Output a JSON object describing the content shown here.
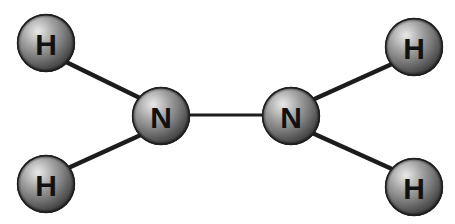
{
  "diagram": {
    "formula": "N2H4",
    "background_color": "#ffffff",
    "canvas": {
      "width": 455,
      "height": 224
    },
    "style": {
      "sphere_highlight_color": "#e6e6e6",
      "sphere_mid_color": "#8a8a8a",
      "sphere_edge_color": "#3a3a3a",
      "sphere_rim_color": "#1e1e1e",
      "bond_color": "#1c1c1c",
      "label_color": "#111111"
    },
    "atoms": [
      {
        "id": "h-top-left",
        "element": "H",
        "label": "H",
        "cx": 46,
        "cy": 43,
        "r": 29,
        "font_size": 30
      },
      {
        "id": "h-bottom-left",
        "element": "H",
        "label": "H",
        "cx": 46,
        "cy": 184,
        "r": 29,
        "font_size": 30
      },
      {
        "id": "n-left",
        "element": "N",
        "label": "N",
        "cx": 161,
        "cy": 116,
        "r": 29,
        "font_size": 30
      },
      {
        "id": "n-right",
        "element": "N",
        "label": "N",
        "cx": 291,
        "cy": 116,
        "r": 29,
        "font_size": 30
      },
      {
        "id": "h-top-right",
        "element": "H",
        "label": "H",
        "cx": 414,
        "cy": 47,
        "r": 29,
        "font_size": 30
      },
      {
        "id": "h-bottom-right",
        "element": "H",
        "label": "H",
        "cx": 414,
        "cy": 187,
        "r": 29,
        "font_size": 30
      }
    ],
    "bonds": [
      {
        "id": "bond-h-top-left-n-left",
        "from": "h-top-left",
        "to": "n-left",
        "x1": 64,
        "y1": 61,
        "x2": 144,
        "y2": 100,
        "width": 4.5
      },
      {
        "id": "bond-h-bottom-left-n-left",
        "from": "h-bottom-left",
        "to": "n-left",
        "x1": 66,
        "y1": 169,
        "x2": 143,
        "y2": 134,
        "width": 4.5
      },
      {
        "id": "bond-n-left-n-right",
        "from": "n-left",
        "to": "n-right",
        "x1": 188,
        "y1": 115,
        "x2": 264,
        "y2": 115,
        "width": 3
      },
      {
        "id": "bond-n-right-h-top-right",
        "from": "n-right",
        "to": "h-top-right",
        "x1": 310,
        "y1": 101,
        "x2": 392,
        "y2": 64,
        "width": 4.5
      },
      {
        "id": "bond-n-right-h-bottom-right",
        "from": "n-right",
        "to": "h-bottom-right",
        "x1": 310,
        "y1": 132,
        "x2": 392,
        "y2": 169,
        "width": 4.5
      }
    ]
  }
}
